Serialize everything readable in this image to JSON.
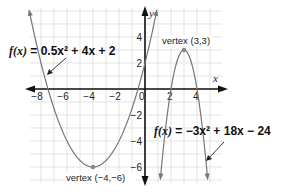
{
  "chart_data": {
    "type": "line",
    "title": "",
    "xlabel": "x",
    "ylabel": "y",
    "xlim": [
      -8.9,
      6
    ],
    "ylim": [
      -7.1,
      6.3
    ],
    "grid": true,
    "x_ticks": [
      "-8",
      "-6",
      "-4",
      "-2",
      "0",
      "2",
      "4"
    ],
    "y_ticks": [
      "4",
      "2",
      "-2",
      "-4",
      "-6"
    ],
    "series": [
      {
        "name": "f(x) = 0.5x^2 + 4x + 2",
        "equation": {
          "a": 0.5,
          "b": 4,
          "c": 2
        },
        "vertex": [
          -4,
          -6
        ],
        "vertex_label": "vertex (−4,−6)"
      },
      {
        "name": "f(x) = −3x^2 + 18x − 24",
        "equation": {
          "a": -3,
          "b": 18,
          "c": -24
        },
        "vertex": [
          3,
          3
        ],
        "vertex_label": "vertex (3,3)"
      }
    ],
    "annotations": [
      {
        "text": "f(x) = 0.5x² + 4x + 2",
        "points_to": "left parabola"
      },
      {
        "text": "f(x) = −3x² + 18x − 24",
        "points_to": "right parabola"
      }
    ]
  },
  "labels": {
    "x_axis": "x",
    "y_axis": "y",
    "eq1_fx": "f(x)",
    "eq1_rhs": " = 0.5x² + 4x + 2",
    "eq2_fx": "f(x)",
    "eq2_rhs": " = −3x² + 18x − 24",
    "vertex1": "vertex (−4,−6)",
    "vertex2": "vertex (3,3)"
  },
  "colors": {
    "curve": "#777777",
    "axis": "#111111",
    "grid": "#d8d8d8"
  }
}
